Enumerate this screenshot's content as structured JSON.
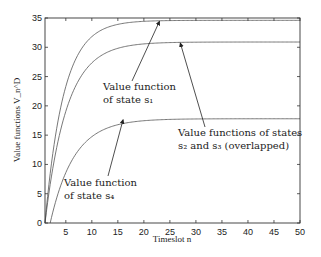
{
  "chart_data": {
    "type": "line",
    "title": "",
    "xlabel": "Timeslot n",
    "ylabel": "Value functions V_n^D",
    "xlim": [
      1,
      50
    ],
    "ylim": [
      0,
      35
    ],
    "xticks": [
      5,
      10,
      15,
      20,
      25,
      30,
      35,
      40,
      45,
      50
    ],
    "yticks": [
      0,
      5,
      10,
      15,
      20,
      25,
      30,
      35
    ],
    "grid": false,
    "series": [
      {
        "name": "state s1",
        "start_x": 1,
        "plateau": 34.6,
        "rate": 0.28
      },
      {
        "name": "states s2 and s3 (overlapped)",
        "start_x": 1,
        "plateau": 30.9,
        "rate": 0.24
      },
      {
        "name": "state s4",
        "start_x": 2,
        "plateau": 17.8,
        "rate": 0.22
      }
    ],
    "annotations": [
      {
        "lines": [
          "Value function",
          "of state s₁"
        ],
        "points_to": {
          "x": 23,
          "y": 34.6
        }
      },
      {
        "lines": [
          "Value functions of states",
          "s₂ and s₃ (overlapped)"
        ],
        "points_to": {
          "x": 27,
          "y": 30.9
        }
      },
      {
        "lines": [
          "Value function",
          "of state s₄"
        ],
        "points_to": {
          "x": 16,
          "y": 17.8
        }
      }
    ]
  }
}
